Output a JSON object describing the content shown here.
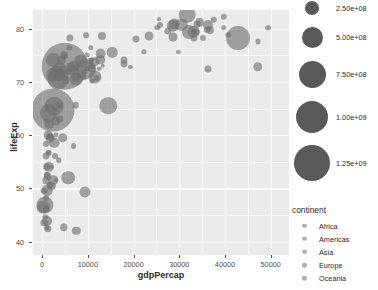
{
  "chart_data": {
    "type": "scatter",
    "title": "",
    "subtitle": "",
    "xlabel": "gdpPercap",
    "ylabel": "lifeExp",
    "xlim": [
      -2000,
      54000
    ],
    "ylim": [
      37.5,
      83.5
    ],
    "grid": true,
    "xticks": [
      0,
      10000,
      20000,
      30000,
      40000,
      50000
    ],
    "xticklabels": [
      "0",
      "10000",
      "20000",
      "30000",
      "40000",
      "50000"
    ],
    "yticks": [
      40,
      50,
      60,
      70,
      80
    ],
    "yticklabels": [
      "40",
      "50",
      "60",
      "70",
      "80"
    ],
    "size_encoding": "pop",
    "color_encoding": "continent",
    "points": [
      {
        "x": 974,
        "y": 43.8,
        "pop": 31889923,
        "c": "Asia"
      },
      {
        "x": 5937,
        "y": 76.4,
        "pop": 3600523,
        "c": "Europe"
      },
      {
        "x": 6223,
        "y": 72.3,
        "pop": 33333216,
        "c": "Africa"
      },
      {
        "x": 4797,
        "y": 42.7,
        "pop": 12420476,
        "c": "Africa"
      },
      {
        "x": 12779,
        "y": 75.3,
        "pop": 40301927,
        "c": "Americas"
      },
      {
        "x": 34435,
        "y": 81.2,
        "pop": 20434176,
        "c": "Oceania"
      },
      {
        "x": 36126,
        "y": 79.8,
        "pop": 8199783,
        "c": "Europe"
      },
      {
        "x": 29796,
        "y": 75.6,
        "pop": 708573,
        "c": "Asia"
      },
      {
        "x": 1391,
        "y": 64.1,
        "pop": 150448339,
        "c": "Asia"
      },
      {
        "x": 33693,
        "y": 79.4,
        "pop": 10392226,
        "c": "Europe"
      },
      {
        "x": 1441,
        "y": 56.7,
        "pop": 8078314,
        "c": "Africa"
      },
      {
        "x": 3823,
        "y": 65.6,
        "pop": 9119152,
        "c": "Americas"
      },
      {
        "x": 4811,
        "y": 74.9,
        "pop": 4552198,
        "c": "Europe"
      },
      {
        "x": 9066,
        "y": 71.8,
        "pop": 1639131,
        "c": "Africa"
      },
      {
        "x": 9645,
        "y": 72.4,
        "pop": 190010647,
        "c": "Americas"
      },
      {
        "x": 10681,
        "y": 73.0,
        "pop": 7322858,
        "c": "Europe"
      },
      {
        "x": 1217,
        "y": 52.3,
        "pop": 14326203,
        "c": "Africa"
      },
      {
        "x": 430,
        "y": 49.6,
        "pop": 8390505,
        "c": "Africa"
      },
      {
        "x": 1713,
        "y": 59.7,
        "pop": 14131858,
        "c": "Asia"
      },
      {
        "x": 2042,
        "y": 50.4,
        "pop": 17696293,
        "c": "Africa"
      },
      {
        "x": 36319,
        "y": 80.7,
        "pop": 33390141,
        "c": "Americas"
      },
      {
        "x": 706,
        "y": 44.7,
        "pop": 4369038,
        "c": "Africa"
      },
      {
        "x": 1704,
        "y": 50.7,
        "pop": 10238807,
        "c": "Africa"
      },
      {
        "x": 13171,
        "y": 78.6,
        "pop": 16284741,
        "c": "Americas"
      },
      {
        "x": 4959,
        "y": 72.9,
        "pop": 1318683096,
        "c": "Asia"
      },
      {
        "x": 7007,
        "y": 72.9,
        "pop": 44227550,
        "c": "Americas"
      },
      {
        "x": 986,
        "y": 65.2,
        "pop": 710960,
        "c": "Africa"
      },
      {
        "x": 277,
        "y": 46.5,
        "pop": 64606759,
        "c": "Africa"
      },
      {
        "x": 3632,
        "y": 55.3,
        "pop": 3800610,
        "c": "Africa"
      },
      {
        "x": 9645,
        "y": 78.8,
        "pop": 4133884,
        "c": "Americas"
      },
      {
        "x": 6025,
        "y": 78.3,
        "pop": 11416987,
        "c": "Americas"
      },
      {
        "x": 36180,
        "y": 72.5,
        "pop": 10228744,
        "c": "Europe"
      },
      {
        "x": 33207,
        "y": 78.3,
        "pop": 10071000,
        "c": "Europe"
      },
      {
        "x": 35278,
        "y": 78.3,
        "pop": 5468120,
        "c": "Europe"
      },
      {
        "x": 2082,
        "y": 54.1,
        "pop": 496374,
        "c": "Africa"
      },
      {
        "x": 6025,
        "y": 72.9,
        "pop": 9319622,
        "c": "Americas"
      },
      {
        "x": 4797,
        "y": 75.0,
        "pop": 13755680,
        "c": "Americas"
      },
      {
        "x": 2412,
        "y": 71.3,
        "pop": 80264543,
        "c": "Africa"
      },
      {
        "x": 5728,
        "y": 71.9,
        "pop": 6939688,
        "c": "Americas"
      },
      {
        "x": 2982,
        "y": 51.6,
        "pop": 551201,
        "c": "Africa"
      },
      {
        "x": 6873,
        "y": 58.0,
        "pop": 4906585,
        "c": "Africa"
      },
      {
        "x": 5755,
        "y": 52.0,
        "pop": 76511887,
        "c": "Africa"
      },
      {
        "x": 33207,
        "y": 79.3,
        "pop": 5238460,
        "c": "Europe"
      },
      {
        "x": 30470,
        "y": 80.7,
        "pop": 61083916,
        "c": "Europe"
      },
      {
        "x": 1327,
        "y": 56.7,
        "pop": 1454867,
        "c": "Africa"
      },
      {
        "x": 13206,
        "y": 73.0,
        "pop": 1272935,
        "c": "Africa"
      },
      {
        "x": 32170,
        "y": 79.4,
        "pop": 82400996,
        "c": "Europe"
      },
      {
        "x": 1327,
        "y": 60.0,
        "pop": 22873338,
        "c": "Africa"
      },
      {
        "x": 27538,
        "y": 79.5,
        "pop": 10706290,
        "c": "Europe"
      },
      {
        "x": 5186,
        "y": 70.3,
        "pop": 12572928,
        "c": "Americas"
      },
      {
        "x": 942,
        "y": 56.0,
        "pop": 9947814,
        "c": "Africa"
      },
      {
        "x": 942,
        "y": 46.4,
        "pop": 1688359,
        "c": "Africa"
      },
      {
        "x": 7320,
        "y": 65.6,
        "pop": 8502814,
        "c": "Americas"
      },
      {
        "x": 39725,
        "y": 82.2,
        "pop": 6980412,
        "c": "Asia"
      },
      {
        "x": 18009,
        "y": 73.3,
        "pop": 9956108,
        "c": "Europe"
      },
      {
        "x": 25523,
        "y": 81.8,
        "pop": 301931,
        "c": "Europe"
      },
      {
        "x": 2452,
        "y": 64.7,
        "pop": 1110396331,
        "c": "Asia"
      },
      {
        "x": 3541,
        "y": 70.6,
        "pop": 223547000,
        "c": "Asia"
      },
      {
        "x": 11606,
        "y": 71.0,
        "pop": 69453570,
        "c": "Asia"
      },
      {
        "x": 4471,
        "y": 59.5,
        "pop": 27499638,
        "c": "Asia"
      },
      {
        "x": 40676,
        "y": 78.9,
        "pop": 4109086,
        "c": "Europe"
      },
      {
        "x": 25768,
        "y": 80.7,
        "pop": 6426679,
        "c": "Asia"
      },
      {
        "x": 28569,
        "y": 80.5,
        "pop": 58147733,
        "c": "Europe"
      },
      {
        "x": 7320,
        "y": 72.6,
        "pop": 2780132,
        "c": "Americas"
      },
      {
        "x": 31656,
        "y": 82.6,
        "pop": 127467972,
        "c": "Asia"
      },
      {
        "x": 4519,
        "y": 72.5,
        "pop": 6053193,
        "c": "Asia"
      },
      {
        "x": 1463,
        "y": 54.1,
        "pop": 35610177,
        "c": "Africa"
      },
      {
        "x": 23348,
        "y": 78.6,
        "pop": 23301725,
        "c": "Asia"
      },
      {
        "x": 47307,
        "y": 77.6,
        "pop": 2505559,
        "c": "Asia"
      },
      {
        "x": 2280,
        "y": 59.5,
        "pop": 2055080,
        "c": "Africa"
      },
      {
        "x": 10956,
        "y": 70.2,
        "pop": 2308800,
        "c": "Europe"
      },
      {
        "x": 1044,
        "y": 42.6,
        "pop": 3195921,
        "c": "Africa"
      },
      {
        "x": 12057,
        "y": 70.7,
        "pop": 5859888,
        "c": "Asia"
      },
      {
        "x": 3095,
        "y": 60.0,
        "pop": 2245000,
        "c": "Africa"
      },
      {
        "x": 9065,
        "y": 70.9,
        "pop": 3600000,
        "c": "Europe"
      },
      {
        "x": 80894,
        "y": 79.3,
        "pop": 480000,
        "c": "Europe"
      },
      {
        "x": 10956,
        "y": 74.2,
        "pop": 2046000,
        "c": "Europe"
      },
      {
        "x": 1714,
        "y": 59.4,
        "pop": 19167654,
        "c": "Africa"
      },
      {
        "x": 12738,
        "y": 74.2,
        "pop": 27014499,
        "c": "Asia"
      },
      {
        "x": 1044,
        "y": 54.1,
        "pop": 13327079,
        "c": "Africa"
      },
      {
        "x": 759,
        "y": 51.5,
        "pop": 12031795,
        "c": "Africa"
      },
      {
        "x": 12451,
        "y": 72.5,
        "pop": 1250882,
        "c": "Americas"
      },
      {
        "x": 3820,
        "y": 72.2,
        "pop": 108700891,
        "c": "Americas"
      },
      {
        "x": 2866,
        "y": 64.7,
        "pop": 2874127,
        "c": "Asia"
      },
      {
        "x": 5937,
        "y": 72.2,
        "pop": 684736,
        "c": "Europe"
      },
      {
        "x": 3820,
        "y": 71.2,
        "pop": 33757175,
        "c": "Africa"
      },
      {
        "x": 7446,
        "y": 42.1,
        "pop": 19951656,
        "c": "Africa"
      },
      {
        "x": 823,
        "y": 62.7,
        "pop": 2055080,
        "c": "Asia"
      },
      {
        "x": 36798,
        "y": 79.8,
        "pop": 16570613,
        "c": "Europe"
      },
      {
        "x": 25185,
        "y": 80.2,
        "pop": 4115771,
        "c": "Oceania"
      },
      {
        "x": 2749,
        "y": 56.0,
        "pop": 5675356,
        "c": "Africa"
      },
      {
        "x": 619,
        "y": 46.9,
        "pop": 135031164,
        "c": "Africa"
      },
      {
        "x": 49357,
        "y": 80.2,
        "pop": 4627926,
        "c": "Europe"
      },
      {
        "x": 22316,
        "y": 75.6,
        "pop": 3204897,
        "c": "Asia"
      },
      {
        "x": 2605,
        "y": 65.5,
        "pop": 169270617,
        "c": "Asia"
      },
      {
        "x": 9809,
        "y": 72.4,
        "pop": 3242173,
        "c": "Americas"
      },
      {
        "x": 4172,
        "y": 71.8,
        "pop": 6667147,
        "c": "Americas"
      },
      {
        "x": 7408,
        "y": 71.0,
        "pop": 28674757,
        "c": "Americas"
      },
      {
        "x": 3190,
        "y": 71.7,
        "pop": 91077287,
        "c": "Asia"
      },
      {
        "x": 15389,
        "y": 75.6,
        "pop": 38518241,
        "c": "Europe"
      },
      {
        "x": 20509,
        "y": 78.1,
        "pop": 10642836,
        "c": "Europe"
      },
      {
        "x": 19328,
        "y": 72.8,
        "pop": 798094,
        "c": "Asia"
      },
      {
        "x": 10808,
        "y": 72.5,
        "pop": 22276056,
        "c": "Europe"
      },
      {
        "x": 14494,
        "y": 65.5,
        "pop": 142893540,
        "c": "Europe"
      },
      {
        "x": 863,
        "y": 46.2,
        "pop": 9907509,
        "c": "Africa"
      },
      {
        "x": 47143,
        "y": 72.8,
        "pop": 27601038,
        "c": "Asia"
      },
      {
        "x": 3820,
        "y": 63.1,
        "pop": 12267493,
        "c": "Africa"
      },
      {
        "x": 10571,
        "y": 74.0,
        "pop": 5447502,
        "c": "Europe"
      },
      {
        "x": 9787,
        "y": 75.0,
        "pop": 2009245,
        "c": "Europe"
      },
      {
        "x": 862,
        "y": 48.2,
        "pop": 5701579,
        "c": "Africa"
      },
      {
        "x": 39724,
        "y": 80.2,
        "pop": 4553009,
        "c": "Africa"
      },
      {
        "x": 9269,
        "y": 49.3,
        "pop": 43997828,
        "c": "Africa"
      },
      {
        "x": 1569,
        "y": 62.0,
        "pop": 20378239,
        "c": "Asia"
      },
      {
        "x": 28821,
        "y": 80.9,
        "pop": 40448191,
        "c": "Europe"
      },
      {
        "x": 2602,
        "y": 58.6,
        "pop": 38139640,
        "c": "Africa"
      },
      {
        "x": 4184,
        "y": 72.0,
        "pop": 1133066,
        "c": "Americas"
      },
      {
        "x": 33859,
        "y": 80.9,
        "pop": 9031088,
        "c": "Europe"
      },
      {
        "x": 37506,
        "y": 81.7,
        "pop": 7554661,
        "c": "Europe"
      },
      {
        "x": 4184,
        "y": 74.1,
        "pop": 19314747,
        "c": "Asia"
      },
      {
        "x": 28718,
        "y": 78.4,
        "pop": 23174294,
        "c": "Asia"
      },
      {
        "x": 1091,
        "y": 52.5,
        "pop": 6688000,
        "c": "Africa"
      },
      {
        "x": 1056,
        "y": 49.7,
        "pop": 38139640,
        "c": "Africa"
      },
      {
        "x": 7458,
        "y": 70.6,
        "pop": 65068149,
        "c": "Asia"
      },
      {
        "x": 882,
        "y": 58.4,
        "pop": 5701579,
        "c": "Africa"
      },
      {
        "x": 18008,
        "y": 74.2,
        "pop": 10276158,
        "c": "Americas"
      },
      {
        "x": 8458,
        "y": 73.9,
        "pop": 71158647,
        "c": "Europe"
      },
      {
        "x": 2479,
        "y": 51.5,
        "pop": 29170398,
        "c": "Africa"
      },
      {
        "x": 33203,
        "y": 79.4,
        "pop": 60776238,
        "c": "Europe"
      },
      {
        "x": 42952,
        "y": 78.2,
        "pop": 301139947,
        "c": "Americas"
      },
      {
        "x": 10611,
        "y": 76.4,
        "pop": 3447496,
        "c": "Americas"
      },
      {
        "x": 11416,
        "y": 73.7,
        "pop": 26084662,
        "c": "Americas"
      },
      {
        "x": 2441,
        "y": 74.2,
        "pop": 85262356,
        "c": "Asia"
      },
      {
        "x": 3025,
        "y": 62.7,
        "pop": 22211743,
        "c": "Asia"
      },
      {
        "x": 1271,
        "y": 42.4,
        "pop": 11746035,
        "c": "Africa"
      },
      {
        "x": 469,
        "y": 43.5,
        "pop": 12311143,
        "c": "Africa"
      }
    ]
  },
  "axes": {
    "x_title": "gdpPercap",
    "y_title": "lifeExp"
  },
  "legend_size": {
    "title": "",
    "entries": [
      {
        "label": "2.50e+08",
        "value": 250000000
      },
      {
        "label": "5.00e+08",
        "value": 500000000
      },
      {
        "label": "7.50e+08",
        "value": 750000000
      },
      {
        "label": "1.00e+09",
        "value": 1000000000
      },
      {
        "label": "1.25e+09",
        "value": 1250000000
      }
    ]
  },
  "legend_continent": {
    "title": "continent",
    "entries": [
      {
        "label": "Africa"
      },
      {
        "label": "Americas"
      },
      {
        "label": "Asia"
      },
      {
        "label": "Europe"
      },
      {
        "label": "Oceania"
      }
    ]
  },
  "style": {
    "panel_bg": "#ebebeb",
    "grid_color": "#ffffff",
    "point_color": "#6f6f6f",
    "text_color": "#2b2b2b",
    "tick_color": "#4d4d4d",
    "legend_key_color": "#595959"
  }
}
